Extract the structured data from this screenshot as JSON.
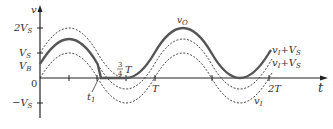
{
  "diagram": {
    "type": "waveform",
    "axes": {
      "y_label": "v",
      "x_label": "t",
      "y_ticks": [
        {
          "label": "2V",
          "sub": "S",
          "level": 2
        },
        {
          "label": "V",
          "sub": "S",
          "level": 1
        },
        {
          "label": "V",
          "sub": "B",
          "level": 0.56
        },
        {
          "label": "0",
          "sub": "",
          "level": 0
        },
        {
          "label": "−V",
          "sub": "S",
          "level": -1
        }
      ],
      "x_ticks": [
        {
          "label": "",
          "period_fraction": 0.25
        },
        {
          "label": "t",
          "sub": "1",
          "period_fraction": 0.52
        },
        {
          "label": "3/4 T",
          "period_fraction": 0.75
        },
        {
          "label": "T",
          "period_fraction": 1.0
        },
        {
          "label": "",
          "period_fraction": 1.5
        },
        {
          "label": "2T",
          "period_fraction": 2.0
        }
      ]
    },
    "labels": {
      "t1_main": "t",
      "t1_sub": "1",
      "three_quarter_num": "3",
      "three_quarter_den": "4",
      "three_quarter_T": "T",
      "T": "T",
      "two_T": "2T",
      "vO_main": "v",
      "vO_sub": "O",
      "curve_top_main": "v",
      "curve_top_sub": "I",
      "curve_top_rest": "+V",
      "curve_top_rest_sub": "S",
      "curve_mid_main": "v",
      "curve_mid_sub": "I",
      "curve_mid_rest": "+V",
      "curve_mid_rest_sub": "S",
      "curve_low_main": "v",
      "curve_low_sub": "I",
      "y_2VS": "2V",
      "y_VS": "V",
      "y_VB": "V",
      "y_zero": "0",
      "y_negVS": "−V",
      "sub_S": "S",
      "sub_B": "B",
      "y_axis": "v",
      "x_axis": "t"
    },
    "curves": [
      {
        "name": "v_I + V_S",
        "style": "dashed",
        "offset": 1.0,
        "amplitude": 1.0
      },
      {
        "name": "v_I + V_B",
        "style": "dashed",
        "offset": 0.56,
        "amplitude": 1.0
      },
      {
        "name": "v_I",
        "style": "dashed",
        "offset": 0,
        "amplitude": 1.0
      },
      {
        "name": "v_O",
        "style": "solid-thick",
        "description": "follows v_I+V_B until t1, clamped at 0 until 3T/4, then follows v_I+V_S"
      }
    ],
    "colors": {
      "axis": "#222222",
      "solid": "#555555",
      "dashed": "#333333",
      "text": "#333333"
    }
  }
}
